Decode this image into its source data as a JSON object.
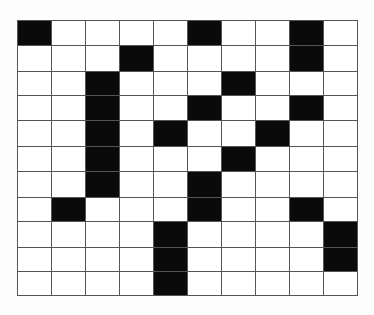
{
  "puzzle": {
    "type": "crossword-grid",
    "rows": 11,
    "cols": 10,
    "colors": {
      "black": "#0a0a0a",
      "white": "#ffffff",
      "line": "#555555"
    },
    "black_cells": [
      [
        0,
        0
      ],
      [
        0,
        5
      ],
      [
        0,
        8
      ],
      [
        1,
        3
      ],
      [
        1,
        8
      ],
      [
        2,
        2
      ],
      [
        2,
        6
      ],
      [
        3,
        2
      ],
      [
        3,
        5
      ],
      [
        3,
        8
      ],
      [
        4,
        2
      ],
      [
        4,
        4
      ],
      [
        4,
        7
      ],
      [
        5,
        2
      ],
      [
        5,
        6
      ],
      [
        6,
        2
      ],
      [
        6,
        5
      ],
      [
        7,
        1
      ],
      [
        7,
        5
      ],
      [
        7,
        8
      ],
      [
        8,
        4
      ],
      [
        8,
        9
      ],
      [
        9,
        4
      ],
      [
        9,
        9
      ],
      [
        10,
        4
      ]
    ]
  }
}
